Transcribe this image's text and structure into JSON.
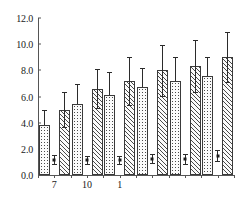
{
  "chart_data": {
    "type": "bar",
    "title": "",
    "xlabel": "",
    "ylabel": "",
    "ylim": [
      0.0,
      12.0
    ],
    "grid": false,
    "legend_position": "none",
    "categories": [
      "7",
      "10",
      "1",
      "",
      "",
      ""
    ],
    "ytick_labels": [
      "0.0",
      "2.0",
      "4.0",
      "6.0",
      "8.0",
      "10.0",
      "12.0"
    ],
    "ytick_values": [
      0.0,
      2.0,
      4.0,
      6.0,
      8.0,
      10.0,
      12.0
    ],
    "xtick_labels": [
      "7",
      "10",
      "1"
    ],
    "series": [
      {
        "name": "dotted-bar-series",
        "pattern": "dotted",
        "values": [
          3.8,
          5.45,
          6.15,
          6.75,
          7.15,
          7.55
        ],
        "err_low": [
          0.0,
          0.0,
          0.0,
          0.0,
          0.0,
          0.0
        ],
        "err_high": [
          1.15,
          1.5,
          1.7,
          1.4,
          1.85,
          1.5
        ]
      },
      {
        "name": "hatched-bar-series",
        "pattern": "diagonal-hatch",
        "values": [
          5.0,
          6.6,
          7.2,
          8.0,
          8.35,
          9.0
        ],
        "err_low": [
          1.35,
          1.5,
          1.85,
          1.95,
          2.0,
          1.9
        ],
        "err_high": [
          1.35,
          1.5,
          1.85,
          1.95,
          2.0,
          1.9
        ]
      },
      {
        "name": "low-marker-series",
        "pattern": "point-with-error-bars",
        "values": [
          1.18,
          1.12,
          1.15,
          1.25,
          1.22,
          1.48
        ],
        "err_low": [
          0.35,
          0.3,
          0.3,
          0.32,
          0.38,
          0.42
        ],
        "err_high": [
          0.35,
          0.3,
          0.3,
          0.32,
          0.38,
          0.42
        ]
      }
    ],
    "annotations": []
  },
  "axes": {
    "y_axis_name": "value-axis",
    "x_axis_name": "category-axis"
  },
  "colors": {
    "axis": "#555555",
    "bar_outline": "#3a3a3a",
    "bar_fill": "#fbfbfb",
    "pattern_ink": "#4a4a4a",
    "error_bar": "#2b2b2b",
    "background": "#ffffff",
    "text": "#1a1a1a"
  }
}
